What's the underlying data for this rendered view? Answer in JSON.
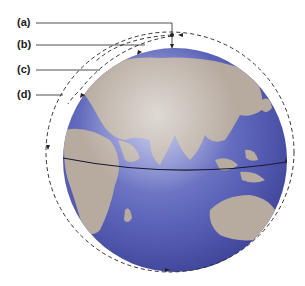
{
  "diagram": {
    "labels": [
      {
        "id": "a",
        "text": "(a)"
      },
      {
        "id": "b",
        "text": "(b)"
      },
      {
        "id": "c",
        "text": "(c)"
      },
      {
        "id": "d",
        "text": "(d)"
      }
    ],
    "globe": {
      "ocean_color": "#5a62b8",
      "land_color": "#b7aba0",
      "equator_color": "#1a1a2e",
      "view": "Eastern hemisphere centered on Asia / Indian Ocean"
    },
    "orbit": {
      "style": "dashed",
      "color": "#333333",
      "direction_arrows": 4
    }
  }
}
